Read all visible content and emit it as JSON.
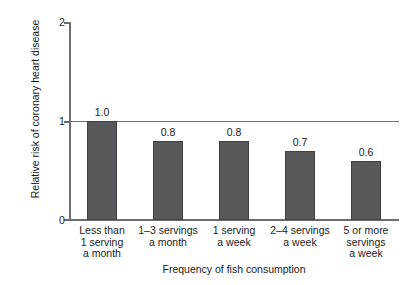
{
  "chart_data": {
    "type": "bar",
    "title": "",
    "xlabel": "Frequency of fish consumption",
    "ylabel": "Relative risk of coronary heart disease",
    "categories": [
      "Less than 1 serving a month",
      "1–3 servings a month",
      "1 serving a week",
      "2–4 servings a week",
      "5 or more servings a week"
    ],
    "category_lines": [
      [
        "Less than",
        "1 serving",
        "a month"
      ],
      [
        "1–3 servings",
        "a month"
      ],
      [
        "1 serving",
        "a week"
      ],
      [
        "2–4 servings",
        "a week"
      ],
      [
        "5 or more",
        "servings",
        "a week"
      ]
    ],
    "values": [
      1.0,
      0.8,
      0.8,
      0.7,
      0.6
    ],
    "value_labels": [
      "1.0",
      "0.8",
      "0.8",
      "0.7",
      "0.6"
    ],
    "ylim": [
      0,
      2
    ],
    "yticks": [
      0,
      1,
      2
    ],
    "ytick_labels": [
      "0",
      "1",
      "2"
    ],
    "grid": false,
    "reference_line": 1,
    "legend": null,
    "bar_color": "#58595b",
    "bar_border_color": "#414042",
    "axis_color": "#6d6e70",
    "background": "#ffffff"
  },
  "axes": {
    "y_title": "Relative risk of coronary heart disease",
    "x_title": "Frequency of fish consumption"
  }
}
